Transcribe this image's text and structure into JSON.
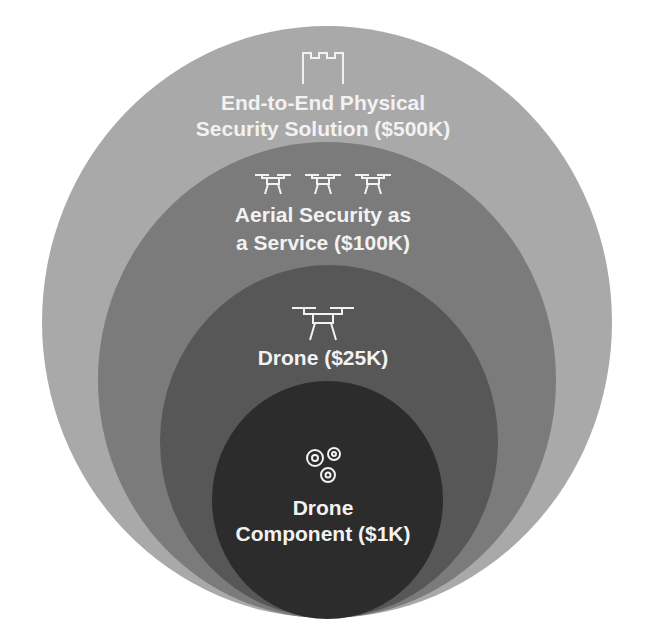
{
  "diagram": {
    "type": "nested-circles",
    "layers": [
      {
        "level": 1,
        "title_line1": "End-to-End Physical",
        "title_line2": "Security Solution ($500K)",
        "label": "End-to-End Physical Security Solution",
        "value": "$500K",
        "icon": "castle-icon",
        "color": "#a9a9a9"
      },
      {
        "level": 2,
        "title_line1": "Aerial Security as",
        "title_line2": "a Service ($100K)",
        "label": "Aerial Security as a Service",
        "value": "$100K",
        "icon": "drone-fleet-icon",
        "color": "#7b7b7b"
      },
      {
        "level": 3,
        "title_line1": "Drone ($25K)",
        "label": "Drone",
        "value": "$25K",
        "icon": "drone-icon",
        "color": "#575757"
      },
      {
        "level": 4,
        "title_line1": "Drone",
        "title_line2": "Component ($1K)",
        "label": "Drone Component",
        "value": "$1K",
        "icon": "gears-icon",
        "color": "#2c2c2c"
      }
    ]
  }
}
